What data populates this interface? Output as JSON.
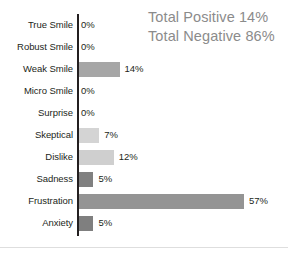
{
  "chart_data": {
    "type": "bar",
    "orientation": "horizontal",
    "title": "",
    "xlabel": "",
    "ylabel": "",
    "xlim": [
      0,
      57
    ],
    "grid": false,
    "legend": false,
    "value_suffix": "%",
    "categories": [
      "True Smile",
      "Robust Smile",
      "Weak Smile",
      "Micro Smile",
      "Surprise",
      "Skeptical",
      "Dislike",
      "Sadness",
      "Frustration",
      "Anxiety"
    ],
    "values": [
      0,
      0,
      14,
      0,
      0,
      7,
      12,
      5,
      57,
      5
    ],
    "value_labels": [
      "0%",
      "0%",
      "14%",
      "0%",
      "0%",
      "7%",
      "12%",
      "5%",
      "57%",
      "5%"
    ],
    "bar_colors": [
      "#a6a6a6",
      "#a6a6a6",
      "#a6a6a6",
      "#a6a6a6",
      "#a6a6a6",
      "#d4d4d4",
      "#cfcfcf",
      "#808080",
      "#949494",
      "#7f7f7f"
    ]
  },
  "summary": {
    "positive": "Total Positive 14%",
    "negative": "Total Negative 86%"
  },
  "style": {
    "axis_color": "#231f20",
    "label_color": "#231f20",
    "summary_color": "#8b8b8b",
    "baseline_color": "#dedede",
    "background": "#ffffff"
  }
}
